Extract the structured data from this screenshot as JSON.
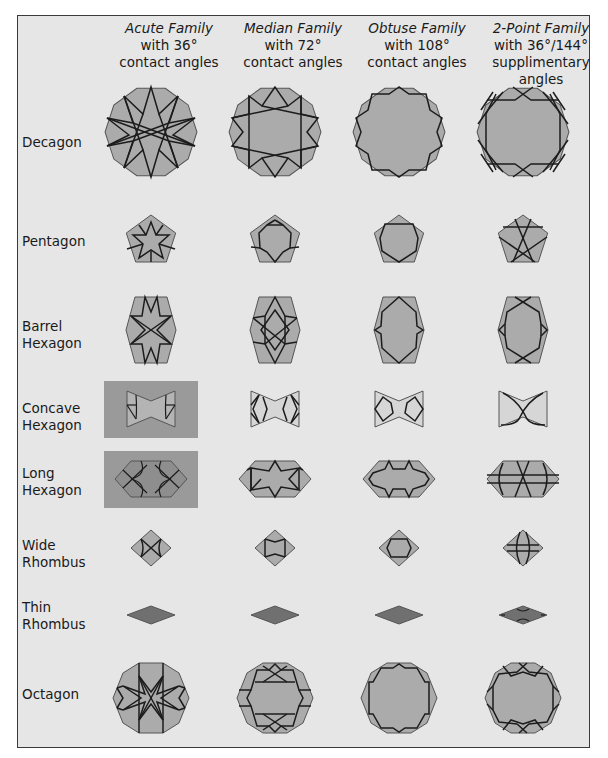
{
  "columns": [
    {
      "family": "Acute Family",
      "line1": "with 36°",
      "line2": "contact angles"
    },
    {
      "family": "Median Family",
      "line1": "with 72°",
      "line2": "contact angles"
    },
    {
      "family": "Obtuse Family",
      "line1": "with 108°",
      "line2": "contact angles"
    },
    {
      "family": "2-Point Family",
      "line1": "with 36°/144°",
      "line2": "supplimentary",
      "line3": "angles"
    }
  ],
  "rows": [
    {
      "label1": "Decagon",
      "label2": ""
    },
    {
      "label1": "Pentagon",
      "label2": ""
    },
    {
      "label1": "Barrel",
      "label2": "Hexagon"
    },
    {
      "label1": "Concave",
      "label2": "Hexagon"
    },
    {
      "label1": "Long",
      "label2": "Hexagon"
    },
    {
      "label1": "Wide",
      "label2": "Rhombus"
    },
    {
      "label1": "Thin",
      "label2": "Rhombus"
    },
    {
      "label1": "Octagon",
      "label2": ""
    }
  ],
  "colors": {
    "background": "#e6e6e6",
    "tile_fill": "#ababab",
    "thin_rhombus_fill": "#707070",
    "highlight_box": "#9a9a9a",
    "pattern_line": "#1c1c1c",
    "border": "#3a3a3a"
  }
}
